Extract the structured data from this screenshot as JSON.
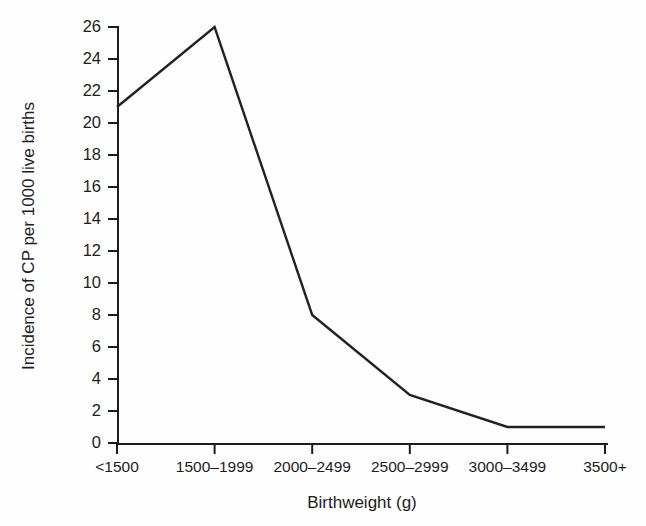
{
  "chart_data": {
    "type": "line",
    "title": "",
    "subtitle": "",
    "xlabel": "Birthweight (g)",
    "ylabel": "Incidence of CP per 1000 live births",
    "categories": [
      "<1500",
      "1500–1999",
      "2000–2499",
      "2500–2999",
      "3000–3499",
      "3500+"
    ],
    "values": [
      21,
      26,
      8,
      3,
      1,
      1
    ],
    "series": [
      {
        "name": "Incidence of CP",
        "values": [
          21,
          26,
          8,
          3,
          1,
          1
        ]
      }
    ],
    "ylim": [
      0,
      26
    ],
    "ytick_values": [
      0,
      2,
      4,
      6,
      8,
      10,
      12,
      14,
      16,
      18,
      20,
      22,
      24,
      26
    ],
    "ytick_labels": [
      "0",
      "2",
      "4",
      "6",
      "8",
      "10",
      "12",
      "14",
      "16",
      "18",
      "20",
      "22",
      "24",
      "26"
    ],
    "xtick_labels": [
      "<1500",
      "1500–1999",
      "2000–2499",
      "2500–2999",
      "3000–3499",
      "3500+"
    ],
    "grid": false,
    "legend": false,
    "legend_position": "none",
    "annotations": [],
    "colors": {
      "line": "#222222",
      "axis": "#1c1c1c",
      "text": "#1d1d1d",
      "background": "#fefefe"
    }
  }
}
